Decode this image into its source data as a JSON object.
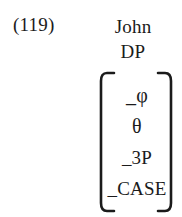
{
  "example": {
    "number": "(119)"
  },
  "head": {
    "lexical_item": "John",
    "category": "DP"
  },
  "matrix": {
    "left_bracket": "left-square-bracket",
    "right_bracket": "right-square-bracket",
    "rows": [
      {
        "text": "_φ"
      },
      {
        "text": "θ"
      },
      {
        "text": "_3P"
      },
      {
        "text": "_CASE"
      }
    ]
  },
  "colors": {
    "ink": "#1b1b1b",
    "page": "#ffffff"
  }
}
